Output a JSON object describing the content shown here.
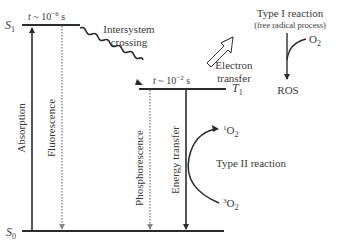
{
  "diagram": {
    "type": "jablonski-photodynamic",
    "levels": {
      "s1": {
        "label": "S",
        "sub": "1",
        "lifetime_prefix": "t ~ 10",
        "lifetime_exp": "−6",
        "lifetime_unit": " s"
      },
      "t1": {
        "label": "T",
        "sub": "1",
        "lifetime_prefix": "t ~ 10",
        "lifetime_exp": "−2",
        "lifetime_unit": " s"
      },
      "s0": {
        "label": "S",
        "sub": "0"
      }
    },
    "transitions": {
      "absorption": "Absorption",
      "fluorescence": "Fluorescence",
      "isc_line1": "Intersystem",
      "isc_line2": "crossing",
      "phosphorescence": "Phosphorescence",
      "energy_transfer": "Energy transfer",
      "electron_transfer_line1": "Electron",
      "electron_transfer_line2": "transfer"
    },
    "type1": {
      "title": "Type I reaction",
      "subtitle": "(free radical process)",
      "o2_label": "O",
      "o2_sub": "2",
      "product": "ROS"
    },
    "type2": {
      "title": "Type II reaction",
      "singlet_sup": "1",
      "triplet_sup": "3",
      "o_label": "O",
      "o_sub": "2"
    },
    "colors": {
      "line": "#2b2b2b",
      "dotted": "#777777",
      "text": "#3a3a3a"
    }
  }
}
